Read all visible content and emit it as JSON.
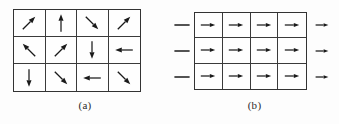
{
  "figure": {
    "background_color": "#fdfdfd",
    "line_color": "#333333",
    "arrow_color": "#1a1a1a"
  },
  "panels": [
    {
      "id": "a",
      "caption": "(a)",
      "grid": {
        "columns": 4,
        "rows": 3,
        "cells": [
          {
            "icon": "arrow-up-right-icon",
            "direction": "up-right",
            "angle_deg": 45,
            "glyph": "↗"
          },
          {
            "icon": "arrow-up-icon",
            "direction": "up",
            "angle_deg": 90,
            "glyph": "↑"
          },
          {
            "icon": "arrow-down-right-icon",
            "direction": "down-right",
            "angle_deg": -45,
            "glyph": "↘"
          },
          {
            "icon": "arrow-up-right-icon",
            "direction": "up-right",
            "angle_deg": 45,
            "glyph": "↗"
          },
          {
            "icon": "arrow-up-left-icon",
            "direction": "up-left",
            "angle_deg": 135,
            "glyph": "↖"
          },
          {
            "icon": "arrow-up-right-icon",
            "direction": "up-right",
            "angle_deg": 45,
            "glyph": "↗"
          },
          {
            "icon": "arrow-down-icon",
            "direction": "down",
            "angle_deg": -90,
            "glyph": "↓"
          },
          {
            "icon": "arrow-left-icon",
            "direction": "left",
            "angle_deg": 180,
            "glyph": "←"
          },
          {
            "icon": "arrow-down-icon",
            "direction": "down",
            "angle_deg": -90,
            "glyph": "↓"
          },
          {
            "icon": "arrow-down-right-icon",
            "direction": "down-right",
            "angle_deg": -45,
            "glyph": "↘"
          },
          {
            "icon": "arrow-left-icon",
            "direction": "left",
            "angle_deg": 180,
            "glyph": "←"
          },
          {
            "icon": "arrow-down-right-icon",
            "direction": "down-right",
            "angle_deg": -45,
            "glyph": "↘"
          }
        ]
      },
      "side_markers": {
        "left": [],
        "right": []
      }
    },
    {
      "id": "b",
      "caption": "(b)",
      "grid": {
        "columns": 4,
        "rows": 3,
        "cells": [
          {
            "icon": "arrow-right-icon",
            "direction": "right",
            "angle_deg": 0,
            "glyph": "→"
          },
          {
            "icon": "arrow-right-icon",
            "direction": "right",
            "angle_deg": 0,
            "glyph": "→"
          },
          {
            "icon": "arrow-right-icon",
            "direction": "right",
            "angle_deg": 0,
            "glyph": "→"
          },
          {
            "icon": "arrow-right-icon",
            "direction": "right",
            "angle_deg": 0,
            "glyph": "→"
          },
          {
            "icon": "arrow-right-icon",
            "direction": "right",
            "angle_deg": 0,
            "glyph": "→"
          },
          {
            "icon": "arrow-right-icon",
            "direction": "right",
            "angle_deg": 0,
            "glyph": "→"
          },
          {
            "icon": "arrow-right-icon",
            "direction": "right",
            "angle_deg": 0,
            "glyph": "→"
          },
          {
            "icon": "arrow-right-icon",
            "direction": "right",
            "angle_deg": 0,
            "glyph": "→"
          },
          {
            "icon": "arrow-right-icon",
            "direction": "right",
            "angle_deg": 0,
            "glyph": "→"
          },
          {
            "icon": "arrow-right-icon",
            "direction": "right",
            "angle_deg": 0,
            "glyph": "→"
          },
          {
            "icon": "arrow-right-icon",
            "direction": "right",
            "angle_deg": 0,
            "glyph": "→"
          },
          {
            "icon": "arrow-right-icon",
            "direction": "right",
            "angle_deg": 0,
            "glyph": "→"
          }
        ]
      },
      "side_markers": {
        "left": [
          {
            "icon": "dash-icon",
            "direction": "none",
            "glyph": "—"
          },
          {
            "icon": "dash-icon",
            "direction": "none",
            "glyph": "—"
          },
          {
            "icon": "dash-icon",
            "direction": "none",
            "glyph": "—"
          }
        ],
        "right": [
          {
            "icon": "arrow-right-icon",
            "direction": "right",
            "glyph": "→"
          },
          {
            "icon": "arrow-right-icon",
            "direction": "right",
            "glyph": "→"
          },
          {
            "icon": "arrow-right-icon",
            "direction": "right",
            "glyph": "→"
          }
        ]
      }
    }
  ]
}
